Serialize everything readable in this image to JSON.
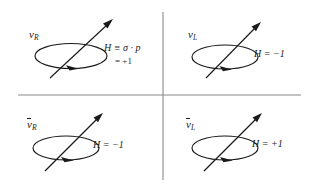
{
  "figure": {
    "name": "neutrino-helicity-diagram",
    "background": "#ffffff",
    "ink": "#1a1a1a",
    "axis_color": "#8a8a8a"
  },
  "quadrants": [
    {
      "id": "top-left",
      "particle": "ν",
      "particle_subscript": "R",
      "overbar": false,
      "helicity_symbol": "H",
      "helicity_text": "H ≡ σ · p",
      "helicity_value": "= +1",
      "has_second_line": true
    },
    {
      "id": "top-right",
      "particle": "ν",
      "particle_subscript": "L",
      "overbar": false,
      "helicity_symbol": "H",
      "helicity_text": "H = −1",
      "helicity_value": "",
      "has_second_line": false
    },
    {
      "id": "bottom-left",
      "particle": "ν",
      "particle_subscript": "R",
      "overbar": true,
      "helicity_symbol": "H",
      "helicity_text": "H = −1",
      "helicity_value": "",
      "has_second_line": false
    },
    {
      "id": "bottom-right",
      "particle": "ν",
      "particle_subscript": "L",
      "overbar": true,
      "helicity_symbol": "H",
      "helicity_text": "H = +1",
      "helicity_value": "",
      "has_second_line": false
    }
  ]
}
